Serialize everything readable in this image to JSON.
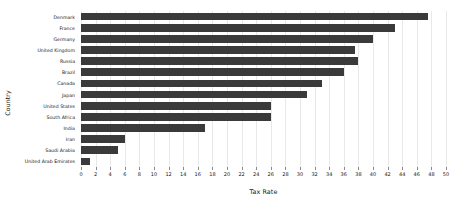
{
  "chart_data": {
    "type": "bar",
    "orientation": "horizontal",
    "title": "",
    "xlabel": "Tax Rate",
    "ylabel": "Country",
    "xlim": [
      0,
      50
    ],
    "xticks": [
      0,
      2,
      4,
      6,
      8,
      10,
      12,
      14,
      16,
      18,
      20,
      22,
      24,
      26,
      28,
      30,
      32,
      34,
      36,
      38,
      40,
      42,
      44,
      46,
      48,
      50
    ],
    "grid": true,
    "grid_axis": "x",
    "legend": false,
    "bar_color": "#3a3a3a",
    "categories": [
      "Denmark",
      "France",
      "Germany",
      "United Kingdom",
      "Russia",
      "Brazil",
      "Canada",
      "Japan",
      "United States",
      "South Africa",
      "India",
      "Iran",
      "Saudi Arabia",
      "United Arab Emirates"
    ],
    "values": [
      47.5,
      43,
      40,
      37.5,
      38,
      36,
      33,
      31,
      26,
      26,
      17,
      6,
      5,
      1.2
    ]
  }
}
